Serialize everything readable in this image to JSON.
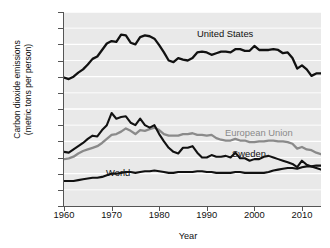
{
  "chart_data": {
    "type": "line",
    "title": "",
    "xlabel": "Year",
    "ylabel": "Carbon dioxide emissions\n(metric tons per person)",
    "xlim": [
      1960,
      2014
    ],
    "ylim": [
      0,
      24
    ],
    "xticks": [
      1960,
      1970,
      1980,
      1990,
      2000,
      2010
    ],
    "xticklabels": [
      "1960",
      "1970",
      "1980",
      "1990",
      "2000",
      "2010"
    ],
    "yticks": [
      0,
      2,
      4,
      6,
      8,
      10,
      12,
      14,
      16,
      18,
      20,
      22,
      24
    ],
    "yticklabels": [
      "0",
      "",
      "4",
      "6",
      "8",
      "10",
      "12",
      "14",
      "16",
      "18",
      "20",
      "22",
      "24"
    ],
    "grid": true,
    "grid_color": "#ffffff",
    "plot_background": "#e9e9e9",
    "legend_position": "inline-labels",
    "x": [
      1960,
      1961,
      1962,
      1963,
      1964,
      1965,
      1966,
      1967,
      1968,
      1969,
      1970,
      1971,
      1972,
      1973,
      1974,
      1975,
      1976,
      1977,
      1978,
      1979,
      1980,
      1981,
      1982,
      1983,
      1984,
      1985,
      1986,
      1987,
      1988,
      1989,
      1990,
      1991,
      1992,
      1993,
      1994,
      1995,
      1996,
      1997,
      1998,
      1999,
      2000,
      2001,
      2002,
      2003,
      2004,
      2005,
      2006,
      2007,
      2008,
      2009,
      2010,
      2011,
      2012,
      2013,
      2014
    ],
    "series": [
      {
        "name": "United States",
        "color": "#111111",
        "width": 2.3,
        "label_x": 1986,
        "label_y": 22.6,
        "values": [
          15.9,
          15.7,
          16.0,
          16.5,
          16.9,
          17.5,
          18.2,
          18.5,
          19.3,
          20.1,
          20.4,
          20.3,
          21.2,
          21.1,
          20.2,
          20.0,
          20.9,
          21.1,
          21.0,
          20.7,
          19.9,
          19.0,
          18.0,
          17.8,
          18.3,
          18.1,
          18.0,
          18.3,
          19.0,
          19.1,
          19.0,
          18.7,
          18.9,
          19.1,
          19.1,
          19.0,
          19.4,
          19.4,
          19.2,
          19.2,
          19.8,
          19.3,
          19.3,
          19.3,
          19.4,
          19.3,
          18.9,
          19.0,
          18.3,
          17.0,
          17.4,
          16.9,
          16.1,
          16.4,
          16.4
        ]
      },
      {
        "name": "Sweden",
        "color": "#111111",
        "width": 2.1,
        "label_x": 2002,
        "label_y": 8.2,
        "values": [
          6.7,
          6.6,
          7.0,
          7.4,
          7.8,
          8.3,
          8.7,
          8.6,
          9.4,
          10.0,
          11.5,
          10.8,
          11.0,
          11.1,
          10.3,
          10.0,
          10.8,
          10.0,
          9.7,
          10.0,
          8.9,
          8.0,
          7.2,
          6.7,
          6.5,
          7.2,
          7.2,
          7.4,
          6.6,
          6.0,
          6.0,
          6.3,
          6.1,
          6.1,
          6.2,
          6.0,
          6.6,
          5.9,
          5.9,
          5.6,
          5.8,
          5.8,
          6.1,
          6.2,
          6.0,
          5.8,
          5.6,
          5.4,
          5.2,
          4.8,
          5.6,
          5.1,
          4.9,
          4.7,
          4.5
        ]
      },
      {
        "name": "European Union",
        "color": "#8a8a8a",
        "width": 2.3,
        "label_x": 2002,
        "label_y": 10.0,
        "values": [
          5.8,
          5.9,
          6.1,
          6.5,
          6.8,
          7.0,
          7.2,
          7.4,
          7.8,
          8.3,
          8.8,
          8.9,
          9.2,
          9.6,
          9.3,
          8.9,
          9.4,
          9.3,
          9.5,
          9.7,
          9.4,
          8.9,
          8.7,
          8.7,
          8.7,
          8.9,
          8.9,
          9.0,
          8.8,
          8.8,
          8.7,
          8.8,
          8.4,
          8.2,
          8.1,
          8.1,
          8.3,
          8.1,
          8.1,
          7.9,
          7.9,
          8.0,
          8.0,
          8.1,
          8.1,
          8.0,
          8.0,
          7.9,
          7.7,
          7.1,
          7.3,
          7.0,
          6.9,
          6.6,
          6.4
        ]
      },
      {
        "name": "World",
        "color": "#111111",
        "width": 2.1,
        "label_x": 1972,
        "label_y": 3.0,
        "values": [
          3.1,
          3.1,
          3.1,
          3.2,
          3.3,
          3.4,
          3.5,
          3.5,
          3.6,
          3.8,
          4.0,
          4.0,
          4.1,
          4.2,
          4.2,
          4.1,
          4.2,
          4.3,
          4.3,
          4.4,
          4.3,
          4.2,
          4.1,
          4.1,
          4.2,
          4.2,
          4.2,
          4.2,
          4.3,
          4.3,
          4.2,
          4.2,
          4.1,
          4.1,
          4.1,
          4.1,
          4.2,
          4.2,
          4.1,
          4.1,
          4.1,
          4.1,
          4.1,
          4.2,
          4.4,
          4.5,
          4.6,
          4.7,
          4.7,
          4.6,
          4.8,
          4.9,
          4.9,
          5.0,
          5.0
        ]
      }
    ]
  },
  "labels": {
    "united_states": "United States",
    "european_union": "European Union",
    "sweden": "Sweden",
    "world": "World",
    "x_axis_title": "Year",
    "y_axis_title": "Carbon dioxide emissions\n(metric tons per person)"
  }
}
